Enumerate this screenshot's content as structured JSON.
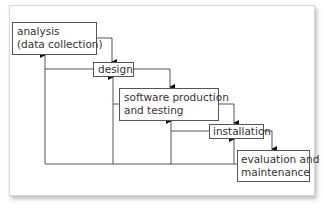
{
  "diagram": {
    "type": "waterfall-process",
    "stages": [
      {
        "id": "analysis",
        "line1": "analysis",
        "line2": "(data collection)"
      },
      {
        "id": "design",
        "line1": "design"
      },
      {
        "id": "software",
        "line1": "software production",
        "line2": "and testing"
      },
      {
        "id": "installation",
        "line1": "installation"
      },
      {
        "id": "evaluation",
        "line1": "evaluation and",
        "line2": "maintenance"
      }
    ],
    "colors": {
      "line": "#555555",
      "text": "#333333",
      "background": "#ffffff"
    }
  }
}
